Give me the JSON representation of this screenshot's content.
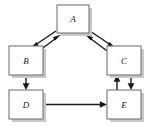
{
  "diagram": {
    "type": "directed-graph",
    "background_color": "#ffffff",
    "node_fill_color": "#ffffff",
    "node_border_color": "#6b6b6b",
    "node_shadow_color": "#c9c9c9",
    "edge_color": "#1a1a1a",
    "nodes": [
      {
        "id": "A",
        "label": "A",
        "x": 57,
        "y": 5,
        "w": 32,
        "h": 28
      },
      {
        "id": "B",
        "label": "B",
        "x": 9,
        "y": 46,
        "w": 34,
        "h": 29
      },
      {
        "id": "C",
        "label": "C",
        "x": 107,
        "y": 46,
        "w": 34,
        "h": 29
      },
      {
        "id": "D",
        "label": "D",
        "x": 9,
        "y": 90,
        "w": 34,
        "h": 29
      },
      {
        "id": "E",
        "label": "E",
        "x": 107,
        "y": 90,
        "w": 34,
        "h": 29
      }
    ],
    "edges": [
      {
        "id": "a-to-b",
        "from": "A",
        "to": "B",
        "direction": "A to B"
      },
      {
        "id": "b-to-a",
        "from": "B",
        "to": "A",
        "direction": "B to A"
      },
      {
        "id": "a-to-c",
        "from": "A",
        "to": "C",
        "direction": "A to C"
      },
      {
        "id": "c-to-a",
        "from": "C",
        "to": "A",
        "direction": "C to A"
      },
      {
        "id": "b-to-d",
        "from": "B",
        "to": "D",
        "direction": "B to D"
      },
      {
        "id": "d-to-e",
        "from": "D",
        "to": "E",
        "direction": "D to E"
      },
      {
        "id": "e-to-c",
        "from": "E",
        "to": "C",
        "direction": "E to C"
      },
      {
        "id": "c-to-e",
        "from": "C",
        "to": "E",
        "direction": "C to E"
      }
    ]
  }
}
